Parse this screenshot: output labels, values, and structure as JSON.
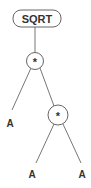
{
  "diagram": {
    "type": "expression-tree",
    "root": {
      "label": "SQRT"
    },
    "nodes": [
      {
        "id": "sqrt",
        "label": "SQRT",
        "shape": "rounded-rect"
      },
      {
        "id": "mul1",
        "label": "*",
        "shape": "circle"
      },
      {
        "id": "a1",
        "label": "A",
        "shape": "text"
      },
      {
        "id": "mul2",
        "label": "*",
        "shape": "circle"
      },
      {
        "id": "a2",
        "label": "A",
        "shape": "text"
      },
      {
        "id": "a3",
        "label": "A",
        "shape": "text"
      }
    ],
    "edges": [
      [
        "sqrt",
        "mul1"
      ],
      [
        "mul1",
        "a1"
      ],
      [
        "mul1",
        "mul2"
      ],
      [
        "mul2",
        "a2"
      ],
      [
        "mul2",
        "a3"
      ]
    ],
    "colors": {
      "line": "#666666",
      "text": "#333333",
      "background": "#ffffff"
    }
  }
}
